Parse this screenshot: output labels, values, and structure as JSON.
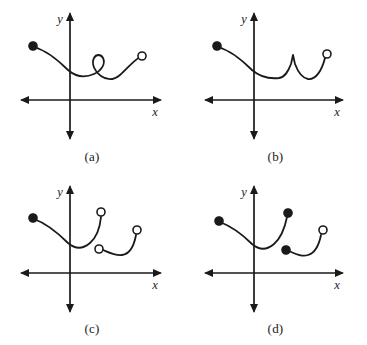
{
  "figure": {
    "background_color": "#ffffff",
    "ink_color": "#1a1a1a",
    "width": 367,
    "height": 345
  },
  "axis": {
    "x_label": "x",
    "y_label": "y",
    "arrowheads": "both-ends-x, up-y, down-y"
  },
  "panels": [
    {
      "id": "a",
      "caption": "(a)",
      "description": "Curve from filled point descends to a minimum, rises into a small closed loop, dips and rises to an open circle endpoint",
      "feature": "loop",
      "left_endpoint_marker": "filled",
      "right_endpoint_marker": "open",
      "is_function": false
    },
    {
      "id": "b",
      "caption": "(b)",
      "description": "Curve from filled point descends to a minimum, rises to a sharp cusp peak, dips and rises to an open circle endpoint",
      "feature": "cusp",
      "left_endpoint_marker": "filled",
      "right_endpoint_marker": "open",
      "is_function": true
    },
    {
      "id": "c",
      "caption": "(c)",
      "description": "First arc from filled point dips and rises to an open circle; second separate arc begins at an open circle, dips and rises to an open circle",
      "feature": "jump-discontinuity",
      "left_endpoint_marker": "filled",
      "arc1_right_marker": "open",
      "arc2_left_marker": "open",
      "arc2_right_marker": "open",
      "is_function": true
    },
    {
      "id": "d",
      "caption": "(d)",
      "description": "First arc from filled point dips and rises to a filled circle; second separate arc begins at a filled circle, dips and rises to an open circle",
      "feature": "jump-discontinuity",
      "left_endpoint_marker": "filled",
      "arc1_right_marker": "filled",
      "arc2_left_marker": "filled",
      "arc2_right_marker": "open",
      "is_function": true
    }
  ]
}
